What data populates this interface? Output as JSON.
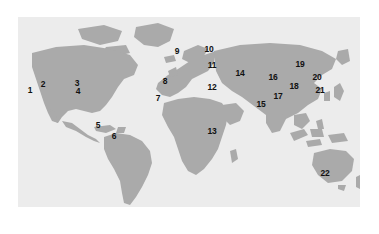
{
  "figure": {
    "type": "world-map",
    "width": 379,
    "height": 234,
    "background_color": "#ffffff",
    "panel": {
      "x": 18,
      "y": 17,
      "width": 342,
      "height": 190,
      "ocean_color": "#ececec",
      "land_color": "#aaaaaa",
      "label_color": "#111111"
    }
  },
  "markers": [
    {
      "label": "1",
      "x": 30,
      "y": 90,
      "region": "western-north-america-baja-california"
    },
    {
      "label": "2",
      "x": 43,
      "y": 84,
      "region": "southwestern-united-states"
    },
    {
      "label": "3",
      "x": 77,
      "y": 83,
      "region": "eastern-united-states"
    },
    {
      "label": "4",
      "x": 78,
      "y": 91,
      "region": "southeastern-united-states-florida"
    },
    {
      "label": "5",
      "x": 98,
      "y": 125,
      "region": "northern-south-america-venezuela"
    },
    {
      "label": "6",
      "x": 114,
      "y": 136,
      "region": "northeastern-brazil"
    },
    {
      "label": "7",
      "x": 158,
      "y": 98,
      "region": "northwest-africa-morocco"
    },
    {
      "label": "8",
      "x": 165,
      "y": 81,
      "region": "iberian-peninsula"
    },
    {
      "label": "9",
      "x": 177,
      "y": 51,
      "region": "northern-europe-scandinavia"
    },
    {
      "label": "10",
      "x": 209,
      "y": 49,
      "region": "northwestern-russia"
    },
    {
      "label": "11",
      "x": 212,
      "y": 65,
      "region": "eastern-europe"
    },
    {
      "label": "12",
      "x": 212,
      "y": 87,
      "region": "eastern-mediterranean-middle-east"
    },
    {
      "label": "13",
      "x": 212,
      "y": 131,
      "region": "east-africa"
    },
    {
      "label": "14",
      "x": 240,
      "y": 73,
      "region": "central-asia"
    },
    {
      "label": "15",
      "x": 261,
      "y": 104,
      "region": "indian-subcontinent"
    },
    {
      "label": "16",
      "x": 273,
      "y": 77,
      "region": "northern-china"
    },
    {
      "label": "17",
      "x": 278,
      "y": 96,
      "region": "southern-china"
    },
    {
      "label": "18",
      "x": 294,
      "y": 86,
      "region": "eastern-china"
    },
    {
      "label": "19",
      "x": 300,
      "y": 64,
      "region": "northeast-china-manchuria"
    },
    {
      "label": "20",
      "x": 317,
      "y": 77,
      "region": "korea-japan"
    },
    {
      "label": "21",
      "x": 320,
      "y": 90,
      "region": "southern-japan"
    },
    {
      "label": "22",
      "x": 325,
      "y": 173,
      "region": "southeastern-australia"
    }
  ]
}
